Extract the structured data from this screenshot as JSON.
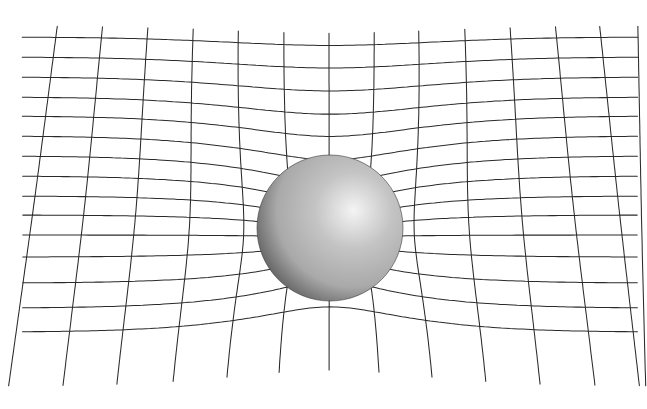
{
  "diagram": {
    "canvas": {
      "width": 647,
      "height": 409,
      "background": "#ffffff"
    },
    "grid": {
      "line_color": "#2a2a2a",
      "horizontal_lines": {
        "count": 15,
        "x_start": 22,
        "x_end": 638,
        "y_positions": [
          37,
          57,
          77,
          97,
          116,
          136,
          156,
          176,
          196,
          215,
          235,
          257,
          283,
          308,
          332
        ]
      },
      "vertical_lines": {
        "count": 14,
        "y_top": 26,
        "y_bottom": 389,
        "x_top": [
          57,
          102,
          147,
          192,
          237,
          283,
          329,
          375,
          420,
          466,
          511,
          556,
          600,
          638
        ],
        "x_bottom": [
          8,
          62,
          115,
          170,
          223,
          276,
          329,
          382,
          436,
          489,
          542,
          596,
          640,
          646
        ]
      },
      "warp": {
        "center_x": 330,
        "center_y": 238,
        "strength": 38,
        "falloff": 120
      }
    },
    "sphere": {
      "center_x": 330,
      "center_y": 228,
      "radius": 73,
      "highlight_x_pct": 66,
      "highlight_y_pct": 38,
      "colors": {
        "highlight": "#f4f4f4",
        "mid": "#a9a9a9",
        "shadow": "#555555",
        "edge": "#3a3a3a"
      }
    }
  }
}
